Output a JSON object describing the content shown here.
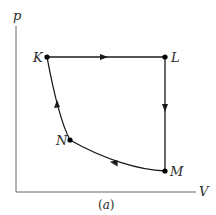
{
  "diagram": {
    "type": "pv-cycle",
    "caption": {
      "open": "(",
      "letter": "a",
      "close": ")"
    },
    "axes": {
      "y_label": "p",
      "x_label": "V"
    },
    "points": {
      "K": {
        "label": "K",
        "x": 47,
        "y": 57
      },
      "L": {
        "label": "L",
        "x": 165,
        "y": 57
      },
      "M": {
        "label": "M",
        "x": 165,
        "y": 171
      },
      "N": {
        "label": "N",
        "x": 70,
        "y": 140
      }
    },
    "paths": [
      {
        "from": "K",
        "to": "L",
        "shape": "straight",
        "direction": "K to L"
      },
      {
        "from": "L",
        "to": "M",
        "shape": "straight",
        "direction": "L to M"
      },
      {
        "from": "M",
        "to": "N",
        "shape": "curve",
        "direction": "M to N"
      },
      {
        "from": "N",
        "to": "K",
        "shape": "curve",
        "direction": "N to K"
      }
    ],
    "colors": {
      "line": "#1a1a1a",
      "axis": "#555555",
      "text": "#2a2a2a"
    }
  }
}
